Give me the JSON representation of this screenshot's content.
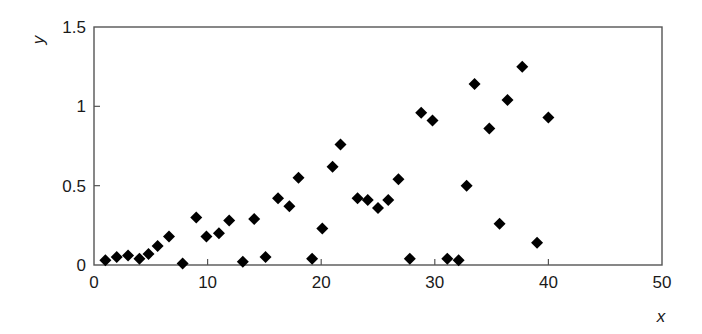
{
  "chart_data": {
    "type": "scatter",
    "title": "",
    "xlabel": "x",
    "ylabel": "y",
    "xlim": [
      0,
      50
    ],
    "ylim": [
      0,
      1.5
    ],
    "xticks": [
      0,
      10,
      20,
      30,
      40,
      50
    ],
    "yticks": [
      0,
      0.5,
      1,
      1.5
    ],
    "xtick_labels": [
      "0",
      "10",
      "20",
      "30",
      "40",
      "50"
    ],
    "ytick_labels": [
      "0",
      "0.5",
      "1",
      "1.5"
    ],
    "grid": false,
    "legend": null,
    "marker": "diamond",
    "marker_color": "#000000",
    "series": [
      {
        "name": "data",
        "points": [
          [
            1.0,
            0.03
          ],
          [
            2.0,
            0.05
          ],
          [
            3.0,
            0.06
          ],
          [
            4.0,
            0.04
          ],
          [
            4.8,
            0.07
          ],
          [
            5.6,
            0.12
          ],
          [
            6.6,
            0.18
          ],
          [
            7.8,
            0.01
          ],
          [
            9.0,
            0.3
          ],
          [
            9.9,
            0.18
          ],
          [
            11.0,
            0.2
          ],
          [
            11.9,
            0.28
          ],
          [
            13.1,
            0.02
          ],
          [
            14.1,
            0.29
          ],
          [
            15.1,
            0.05
          ],
          [
            16.2,
            0.42
          ],
          [
            17.2,
            0.37
          ],
          [
            18.0,
            0.55
          ],
          [
            19.2,
            0.04
          ],
          [
            20.1,
            0.23
          ],
          [
            21.0,
            0.62
          ],
          [
            21.7,
            0.76
          ],
          [
            23.2,
            0.42
          ],
          [
            24.1,
            0.41
          ],
          [
            25.0,
            0.36
          ],
          [
            25.9,
            0.41
          ],
          [
            26.8,
            0.54
          ],
          [
            27.8,
            0.04
          ],
          [
            28.8,
            0.96
          ],
          [
            29.8,
            0.91
          ],
          [
            31.1,
            0.04
          ],
          [
            32.1,
            0.03
          ],
          [
            32.8,
            0.5
          ],
          [
            33.5,
            1.14
          ],
          [
            34.8,
            0.86
          ],
          [
            35.7,
            0.26
          ],
          [
            36.4,
            1.04
          ],
          [
            37.7,
            1.25
          ],
          [
            39.0,
            0.14
          ],
          [
            40.0,
            0.93
          ]
        ]
      }
    ]
  }
}
